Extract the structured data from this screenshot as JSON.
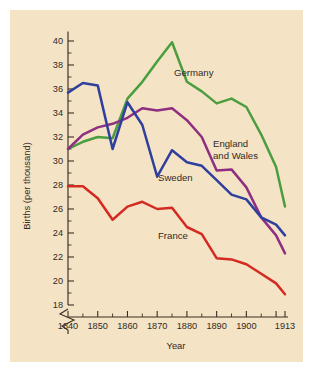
{
  "figure": {
    "background_color": "#f4e3c4",
    "page_color": "#ffffff",
    "axis_color": "#3a2f22",
    "text_color": "#33291e"
  },
  "chart_data": {
    "type": "line",
    "title": "",
    "xlabel": "Year",
    "ylabel": "Births (per thousand)",
    "x": [
      1840,
      1845,
      1850,
      1855,
      1860,
      1865,
      1870,
      1875,
      1880,
      1885,
      1890,
      1895,
      1900,
      1905,
      1910,
      1913
    ],
    "xlim": [
      1840,
      1913
    ],
    "ylim": [
      17.2,
      40.8
    ],
    "yticks": [
      18,
      20,
      22,
      24,
      26,
      28,
      30,
      32,
      34,
      36,
      38,
      40
    ],
    "ytick_labels": [
      "18",
      "20",
      "22",
      "24",
      "26",
      "28",
      "30",
      "32",
      "34",
      "36",
      "38",
      "40"
    ],
    "xticks": [
      1840,
      1845,
      1850,
      1855,
      1860,
      1865,
      1870,
      1875,
      1880,
      1885,
      1890,
      1895,
      1900,
      1905,
      1910,
      1913
    ],
    "xtick_labels_major": [
      "1840",
      "1850",
      "1860",
      "1870",
      "1880",
      "1890",
      "1900",
      "1913"
    ],
    "xtick_major_values": [
      1840,
      1850,
      1860,
      1870,
      1880,
      1890,
      1900,
      1913
    ],
    "grid": false,
    "axis_break": "y-axis broken below 18",
    "legend_position": "inline-labels",
    "series": [
      {
        "name": "Germany",
        "color": "#4a9e3f",
        "label_x": 1878,
        "label_y": 37.4,
        "values": [
          31.0,
          31.6,
          32.0,
          31.9,
          35.2,
          36.6,
          38.3,
          39.9,
          36.6,
          35.8,
          34.8,
          35.2,
          34.5,
          32.2,
          29.5,
          26.2
        ]
      },
      {
        "name": "England and Wales",
        "color": "#8e2f80",
        "label_x": 1889,
        "label_y": 31.2,
        "values": [
          31.0,
          32.2,
          32.8,
          33.1,
          33.6,
          34.4,
          34.2,
          34.4,
          33.4,
          32.0,
          29.2,
          29.3,
          27.8,
          25.3,
          23.8,
          22.3
        ]
      },
      {
        "name": "Sweden",
        "color": "#2f3f9e",
        "label_x": 1873,
        "label_y": 29.3,
        "values": [
          35.7,
          36.5,
          36.3,
          31.0,
          34.9,
          33.0,
          28.7,
          30.9,
          29.9,
          29.6,
          28.4,
          27.2,
          26.8,
          25.3,
          24.7,
          23.8
        ]
      },
      {
        "name": "France",
        "color": "#d32a22",
        "label_x": 1873,
        "label_y": 24.0,
        "values": [
          27.9,
          27.9,
          26.9,
          25.1,
          26.2,
          26.6,
          26.0,
          26.1,
          24.5,
          23.9,
          21.9,
          21.8,
          21.4,
          20.6,
          19.8,
          18.9
        ]
      }
    ]
  },
  "labels": {
    "germany": "Germany",
    "england_line1": "England",
    "england_line2": "and Wales",
    "sweden": "Sweden",
    "france": "France",
    "xaxis_title": "Year",
    "yaxis_title": "Births (per thousand)"
  }
}
